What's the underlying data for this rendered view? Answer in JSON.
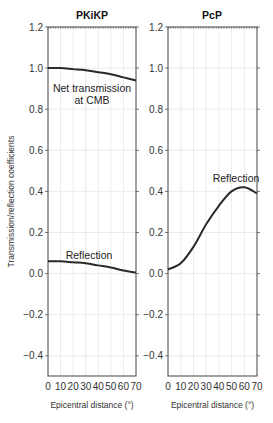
{
  "chart_data": [
    {
      "type": "line",
      "title": "PKiKP",
      "xlabel": "Epicentral distance (°)",
      "ylabel": "Transmission/reflection coefficients",
      "xlim": [
        0,
        70
      ],
      "ylim": [
        -0.5,
        1.2
      ],
      "x_ticks": [
        "0",
        "10",
        "20",
        "30",
        "40",
        "50",
        "60",
        "70"
      ],
      "y_ticks": [
        "1.2",
        "1.0",
        "0.8",
        "0.6",
        "0.4",
        "0.2",
        "0.0",
        "-0.2",
        "-0.4"
      ],
      "grid": true,
      "series": [
        {
          "name": "Net transmission at CMB",
          "x": [
            0,
            10,
            20,
            30,
            40,
            50,
            60,
            70
          ],
          "values": [
            1.0,
            1.0,
            0.995,
            0.99,
            0.98,
            0.97,
            0.955,
            0.94
          ]
        },
        {
          "name": "Reflection",
          "x": [
            0,
            10,
            20,
            30,
            40,
            50,
            60,
            70
          ],
          "values": [
            0.06,
            0.06,
            0.055,
            0.05,
            0.04,
            0.03,
            0.015,
            0.005
          ]
        }
      ],
      "annotations": [
        "Net transmission",
        "at CMB",
        "Reflection"
      ]
    },
    {
      "type": "line",
      "title": "PcP",
      "xlabel": "Epicentral distance (°)",
      "ylabel": "",
      "xlim": [
        0,
        70
      ],
      "ylim": [
        -0.5,
        1.2
      ],
      "x_ticks": [
        "0",
        "10",
        "20",
        "30",
        "40",
        "50",
        "60",
        "70"
      ],
      "y_ticks": [
        "1.2",
        "1.0",
        "0.8",
        "0.6",
        "0.4",
        "0.2",
        "0.0",
        "-0.2",
        "-0.4"
      ],
      "grid": true,
      "series": [
        {
          "name": "Reflection",
          "x": [
            0,
            10,
            20,
            30,
            40,
            50,
            60,
            70
          ],
          "values": [
            0.02,
            0.05,
            0.13,
            0.24,
            0.33,
            0.4,
            0.42,
            0.39
          ]
        }
      ],
      "annotations": [
        "Reflection"
      ]
    }
  ]
}
